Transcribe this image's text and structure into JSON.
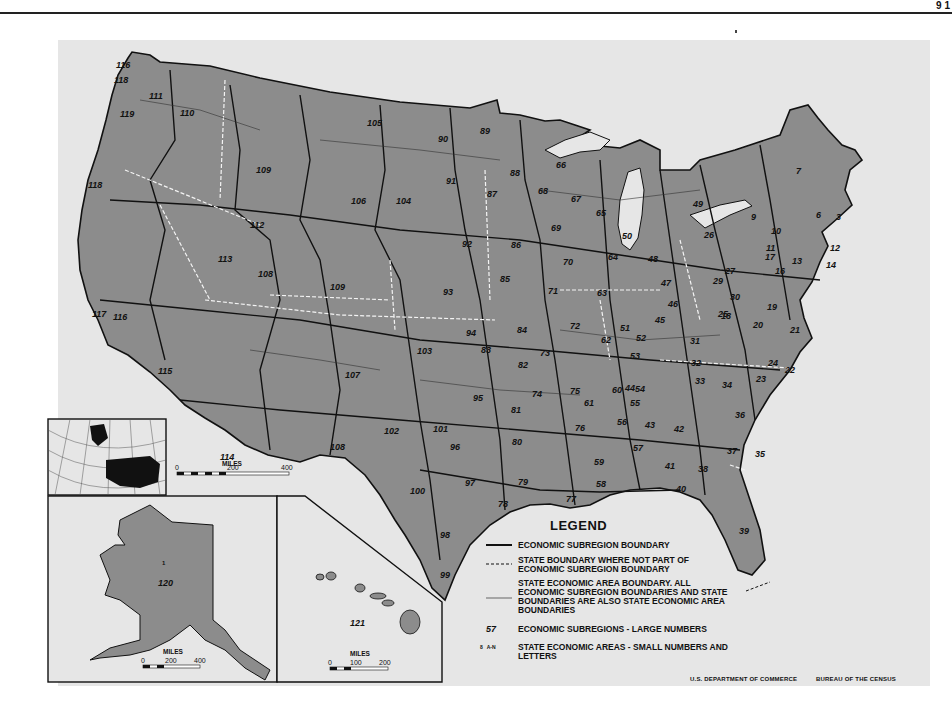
{
  "page": {
    "corner_mark": "9 1"
  },
  "map": {
    "title_absent": true,
    "fill_color": "#8c8c8c",
    "background_color": "#e6e6e6",
    "subregion_labels": [
      {
        "n": "116",
        "x": 116,
        "y": 60
      },
      {
        "n": "118",
        "x": 114,
        "y": 75
      },
      {
        "n": "111",
        "x": 149,
        "y": 91
      },
      {
        "n": "110",
        "x": 180,
        "y": 108
      },
      {
        "n": "119",
        "x": 120,
        "y": 109
      },
      {
        "n": "118",
        "x": 88,
        "y": 180
      },
      {
        "n": "109",
        "x": 256,
        "y": 165
      },
      {
        "n": "105",
        "x": 367,
        "y": 118
      },
      {
        "n": "90",
        "x": 438,
        "y": 134
      },
      {
        "n": "89",
        "x": 480,
        "y": 126
      },
      {
        "n": "106",
        "x": 351,
        "y": 196
      },
      {
        "n": "104",
        "x": 396,
        "y": 196
      },
      {
        "n": "91",
        "x": 446,
        "y": 176
      },
      {
        "n": "87",
        "x": 487,
        "y": 189
      },
      {
        "n": "88",
        "x": 510,
        "y": 168
      },
      {
        "n": "68",
        "x": 538,
        "y": 186
      },
      {
        "n": "66",
        "x": 556,
        "y": 160
      },
      {
        "n": "67",
        "x": 571,
        "y": 194
      },
      {
        "n": "65",
        "x": 596,
        "y": 208
      },
      {
        "n": "112",
        "x": 250,
        "y": 220
      },
      {
        "n": "113",
        "x": 218,
        "y": 254
      },
      {
        "n": "93",
        "x": 443,
        "y": 287
      },
      {
        "n": "92",
        "x": 462,
        "y": 239
      },
      {
        "n": "86",
        "x": 511,
        "y": 240
      },
      {
        "n": "69",
        "x": 551,
        "y": 223
      },
      {
        "n": "70",
        "x": 563,
        "y": 257
      },
      {
        "n": "50",
        "x": 622,
        "y": 231
      },
      {
        "n": "64",
        "x": 608,
        "y": 252
      },
      {
        "n": "48",
        "x": 648,
        "y": 254
      },
      {
        "n": "49",
        "x": 693,
        "y": 199
      },
      {
        "n": "26",
        "x": 704,
        "y": 230
      },
      {
        "n": "9",
        "x": 751,
        "y": 212
      },
      {
        "n": "7",
        "x": 796,
        "y": 166
      },
      {
        "n": "10",
        "x": 771,
        "y": 226
      },
      {
        "n": "6",
        "x": 816,
        "y": 210
      },
      {
        "n": "3",
        "x": 836,
        "y": 212
      },
      {
        "n": "12",
        "x": 830,
        "y": 243
      },
      {
        "n": "14",
        "x": 826,
        "y": 260
      },
      {
        "n": "17",
        "x": 765,
        "y": 252
      },
      {
        "n": "11",
        "x": 766,
        "y": 243
      },
      {
        "n": "13",
        "x": 792,
        "y": 256
      },
      {
        "n": "16",
        "x": 775,
        "y": 266
      },
      {
        "n": "27",
        "x": 725,
        "y": 266
      },
      {
        "n": "29",
        "x": 713,
        "y": 276
      },
      {
        "n": "47",
        "x": 661,
        "y": 278
      },
      {
        "n": "71",
        "x": 548,
        "y": 286
      },
      {
        "n": "85",
        "x": 500,
        "y": 274
      },
      {
        "n": "63",
        "x": 597,
        "y": 288
      },
      {
        "n": "109",
        "x": 330,
        "y": 282
      },
      {
        "n": "108",
        "x": 258,
        "y": 269
      },
      {
        "n": "94",
        "x": 466,
        "y": 328
      },
      {
        "n": "84",
        "x": 517,
        "y": 325
      },
      {
        "n": "72",
        "x": 570,
        "y": 321
      },
      {
        "n": "73",
        "x": 540,
        "y": 348
      },
      {
        "n": "103",
        "x": 417,
        "y": 346
      },
      {
        "n": "83",
        "x": 481,
        "y": 345
      },
      {
        "n": "82",
        "x": 518,
        "y": 360
      },
      {
        "n": "30",
        "x": 730,
        "y": 292
      },
      {
        "n": "25",
        "x": 718,
        "y": 309
      },
      {
        "n": "18",
        "x": 721,
        "y": 311
      },
      {
        "n": "19",
        "x": 767,
        "y": 302
      },
      {
        "n": "20",
        "x": 753,
        "y": 320
      },
      {
        "n": "21",
        "x": 790,
        "y": 325
      },
      {
        "n": "46",
        "x": 668,
        "y": 299
      },
      {
        "n": "45",
        "x": 655,
        "y": 315
      },
      {
        "n": "31",
        "x": 690,
        "y": 336
      },
      {
        "n": "52",
        "x": 636,
        "y": 333
      },
      {
        "n": "51",
        "x": 620,
        "y": 323
      },
      {
        "n": "62",
        "x": 601,
        "y": 335
      },
      {
        "n": "53",
        "x": 630,
        "y": 351
      },
      {
        "n": "32",
        "x": 691,
        "y": 358
      },
      {
        "n": "33",
        "x": 695,
        "y": 376
      },
      {
        "n": "34",
        "x": 722,
        "y": 380
      },
      {
        "n": "23",
        "x": 756,
        "y": 374
      },
      {
        "n": "24",
        "x": 768,
        "y": 358
      },
      {
        "n": "22",
        "x": 785,
        "y": 365
      },
      {
        "n": "107",
        "x": 345,
        "y": 370
      },
      {
        "n": "75",
        "x": 570,
        "y": 386
      },
      {
        "n": "74",
        "x": 532,
        "y": 389
      },
      {
        "n": "61",
        "x": 584,
        "y": 398
      },
      {
        "n": "60",
        "x": 612,
        "y": 385
      },
      {
        "n": "44",
        "x": 625,
        "y": 383
      },
      {
        "n": "54",
        "x": 635,
        "y": 384
      },
      {
        "n": "55",
        "x": 630,
        "y": 398
      },
      {
        "n": "81",
        "x": 511,
        "y": 405
      },
      {
        "n": "95",
        "x": 473,
        "y": 393
      },
      {
        "n": "101",
        "x": 433,
        "y": 424
      },
      {
        "n": "102",
        "x": 384,
        "y": 426
      },
      {
        "n": "96",
        "x": 450,
        "y": 442
      },
      {
        "n": "80",
        "x": 512,
        "y": 437
      },
      {
        "n": "76",
        "x": 575,
        "y": 423
      },
      {
        "n": "56",
        "x": 617,
        "y": 417
      },
      {
        "n": "43",
        "x": 645,
        "y": 420
      },
      {
        "n": "42",
        "x": 674,
        "y": 424
      },
      {
        "n": "36",
        "x": 735,
        "y": 410
      },
      {
        "n": "35",
        "x": 755,
        "y": 449
      },
      {
        "n": "37",
        "x": 727,
        "y": 446
      },
      {
        "n": "57",
        "x": 633,
        "y": 443
      },
      {
        "n": "59",
        "x": 594,
        "y": 457
      },
      {
        "n": "41",
        "x": 665,
        "y": 461
      },
      {
        "n": "38",
        "x": 698,
        "y": 464
      },
      {
        "n": "40",
        "x": 676,
        "y": 484
      },
      {
        "n": "39",
        "x": 739,
        "y": 526
      },
      {
        "n": "108",
        "x": 330,
        "y": 442
      },
      {
        "n": "100",
        "x": 410,
        "y": 486
      },
      {
        "n": "97",
        "x": 465,
        "y": 478
      },
      {
        "n": "79",
        "x": 518,
        "y": 477
      },
      {
        "n": "78",
        "x": 498,
        "y": 499
      },
      {
        "n": "77",
        "x": 566,
        "y": 494
      },
      {
        "n": "58",
        "x": 596,
        "y": 479
      },
      {
        "n": "98",
        "x": 440,
        "y": 530
      },
      {
        "n": "99",
        "x": 440,
        "y": 570
      },
      {
        "n": "115",
        "x": 158,
        "y": 366
      },
      {
        "n": "117",
        "x": 92,
        "y": 309
      },
      {
        "n": "116",
        "x": 113,
        "y": 312
      },
      {
        "n": "114",
        "x": 220,
        "y": 452
      },
      {
        "n": "120",
        "x": 158,
        "y": 578
      },
      {
        "n": "121",
        "x": 350,
        "y": 618
      }
    ]
  },
  "inset_globe": {
    "label": "locator-globe"
  },
  "scale_main": {
    "unit": "MILES",
    "ticks": [
      "0",
      "200",
      "400"
    ]
  },
  "inset_alaska": {
    "subregion": "120",
    "area": "1",
    "scale_unit": "MILES",
    "scale_ticks": [
      "0",
      "200",
      "400"
    ]
  },
  "inset_hawaii": {
    "subregion": "121",
    "scale_unit": "MILES",
    "scale_ticks": [
      "0",
      "100",
      "200"
    ]
  },
  "legend": {
    "title": "LEGEND",
    "items": [
      {
        "symbol": "solid-thick",
        "text": "ECONOMIC SUBREGION BOUNDARY"
      },
      {
        "symbol": "dashed",
        "text": "STATE BOUNDARY WHERE NOT PART OF ECONOMIC SUBREGION BOUNDARY"
      },
      {
        "symbol": "solid-thin",
        "text": "STATE ECONOMIC AREA BOUNDARY. ALL ECONOMIC SUBREGION BOUNDARIES AND STATE BOUNDARIES ARE ALSO STATE ECONOMIC AREA BOUNDARIES"
      },
      {
        "symbol": "57",
        "text": "ECONOMIC SUBREGIONS - LARGE NUMBERS"
      },
      {
        "symbol": "8   A-N",
        "text": "STATE ECONOMIC AREAS - SMALL NUMBERS AND LETTERS"
      }
    ]
  },
  "credits": {
    "left": "U.S. DEPARTMENT OF COMMERCE",
    "right": "BUREAU OF THE CENSUS"
  }
}
